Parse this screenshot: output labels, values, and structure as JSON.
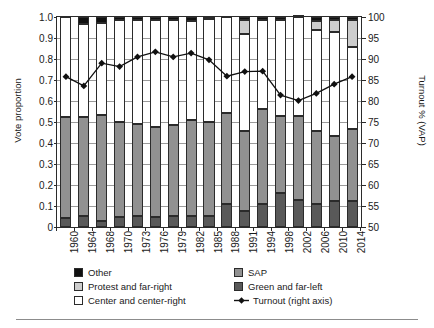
{
  "chart_data": {
    "type": "bar",
    "title": "",
    "subtitle": "",
    "xlabel": "",
    "ylabel": "Vote proportion",
    "y2label": "Turnout % (VAP)",
    "ylim": [
      0,
      1.0
    ],
    "y2lim": [
      50,
      100
    ],
    "grid": true,
    "legend_position": "bottom",
    "stacked": true,
    "categories": [
      "1960",
      "1964",
      "1968",
      "1970",
      "1973",
      "1976",
      "1979",
      "1982",
      "1985",
      "1988",
      "1991",
      "1994",
      "1998",
      "2002",
      "2006",
      "2010",
      "2014"
    ],
    "yticks_left": [
      "0",
      "0.1",
      "0.2",
      "0.3",
      "0.4",
      "0.5",
      "0.6",
      "0.7",
      "0.8",
      "0.9",
      "1.0"
    ],
    "yticks_right": [
      "50",
      "55",
      "60",
      "65",
      "70",
      "75",
      "80",
      "85",
      "90",
      "95",
      "100"
    ],
    "series": [
      {
        "name": "Green and far-left",
        "color": "#595959",
        "values": [
          0.045,
          0.052,
          0.029,
          0.048,
          0.051,
          0.049,
          0.054,
          0.054,
          0.052,
          0.111,
          0.076,
          0.109,
          0.163,
          0.127,
          0.109,
          0.123,
          0.123
        ]
      },
      {
        "name": "SAP",
        "color": "#919191",
        "values": [
          0.477,
          0.473,
          0.503,
          0.453,
          0.438,
          0.427,
          0.434,
          0.456,
          0.448,
          0.432,
          0.379,
          0.452,
          0.364,
          0.4,
          0.349,
          0.31,
          0.344
        ]
      },
      {
        "name": "Center and center-right",
        "color": "#ffffff",
        "values": [
          0.478,
          0.443,
          0.438,
          0.487,
          0.497,
          0.511,
          0.496,
          0.47,
          0.489,
          0.457,
          0.465,
          0.427,
          0.457,
          0.471,
          0.481,
          0.494,
          0.389
        ]
      },
      {
        "name": "Protest and far-right",
        "color": "#cdcdcd",
        "values": [
          0.0,
          0.0,
          0.0,
          0.0,
          0.0,
          0.0,
          0.0,
          0.0,
          0.0,
          0.0,
          0.065,
          0.0,
          0.0,
          0.0,
          0.04,
          0.057,
          0.129
        ]
      },
      {
        "name": "Other",
        "color": "#111111",
        "values": [
          0.0,
          0.032,
          0.03,
          0.012,
          0.014,
          0.013,
          0.016,
          0.02,
          0.011,
          0.0,
          0.015,
          0.012,
          0.016,
          0.002,
          0.021,
          0.016,
          0.015
        ]
      }
    ],
    "line_series": {
      "name": "Turnout (right axis)",
      "axis": "right",
      "color": "#111111",
      "marker": "diamond",
      "values": [
        85.8,
        83.6,
        89.0,
        88.2,
        90.5,
        91.7,
        90.5,
        91.4,
        89.8,
        85.9,
        87.0,
        87.1,
        81.4,
        80.1,
        81.8,
        84.0,
        85.8
      ]
    }
  },
  "axes": {
    "left_title": "Vote proportion",
    "right_title": "Turnout % (VAP)"
  },
  "legend": {
    "items": [
      {
        "label": "Other",
        "swatch": "other",
        "kind": "swatch"
      },
      {
        "label": "SAP",
        "swatch": "sap",
        "kind": "swatch"
      },
      {
        "label": "Protest and far-right",
        "swatch": "protest",
        "kind": "swatch"
      },
      {
        "label": "Green and far-left",
        "swatch": "green",
        "kind": "swatch"
      },
      {
        "label": "Center and center-right",
        "swatch": "center",
        "kind": "swatch"
      },
      {
        "label": "Turnout (right axis)",
        "swatch": "line",
        "kind": "line"
      }
    ]
  }
}
